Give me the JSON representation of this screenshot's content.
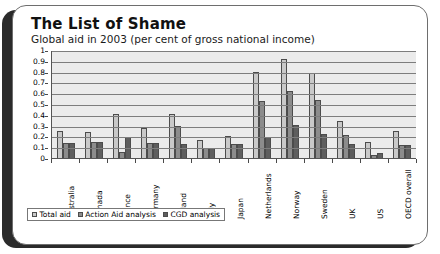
{
  "card": {
    "title": "The List of Shame",
    "subtitle": "Global aid in 2003 (per cent of gross national income)"
  },
  "chart_data": {
    "type": "bar",
    "title": "The List of Shame",
    "subtitle": "Global aid in 2003 (per cent of gross national income)",
    "xlabel": "",
    "ylabel": "",
    "ylim": [
      0,
      1
    ],
    "yticks": [
      "0",
      "0.1",
      "0.2",
      "0.3",
      "0.4",
      "0.5",
      "0.6",
      "0.7",
      "0.8",
      "0.9",
      "1"
    ],
    "grid": true,
    "legend_position": "bottom-left",
    "categories": [
      "Australia",
      "Canada",
      "France",
      "Germany",
      "Ireland",
      "Italy",
      "Japan",
      "Netherlands",
      "Norway",
      "Sweden",
      "UK",
      "US",
      "OECD overall"
    ],
    "series": [
      {
        "name": "Total aid",
        "color": "#c9c9c9",
        "values": [
          0.25,
          0.24,
          0.41,
          0.28,
          0.41,
          0.17,
          0.2,
          0.8,
          0.92,
          0.79,
          0.34,
          0.15,
          0.25
        ]
      },
      {
        "name": "Action Aid analysis",
        "color": "#8c8c8c",
        "values": [
          0.14,
          0.15,
          0.06,
          0.14,
          0.3,
          0.09,
          0.13,
          0.53,
          0.62,
          0.54,
          0.21,
          0.03,
          0.12
        ]
      },
      {
        "name": "CGD analysis",
        "color": "#5e5e5e",
        "values": [
          0.14,
          0.15,
          0.19,
          0.14,
          0.13,
          0.09,
          0.13,
          0.19,
          0.31,
          0.22,
          0.13,
          0.05,
          0.12
        ]
      }
    ]
  }
}
